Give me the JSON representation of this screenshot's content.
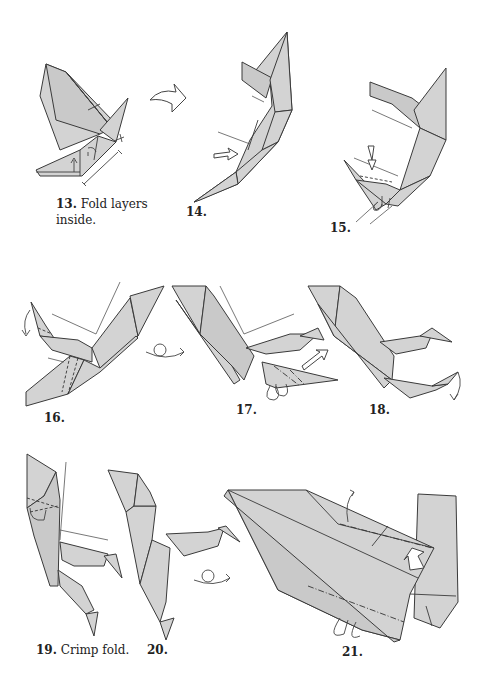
{
  "page": {
    "paper_color": "#d3d3d3",
    "outline_color": "#3a3a3a",
    "background": "#ffffff"
  },
  "steps": [
    {
      "number": "13.",
      "caption": "Fold layers",
      "caption_line2": "inside."
    },
    {
      "number": "14.",
      "caption": ""
    },
    {
      "number": "15.",
      "caption": ""
    },
    {
      "number": "16.",
      "caption": ""
    },
    {
      "number": "17.",
      "caption": ""
    },
    {
      "number": "18.",
      "caption": ""
    },
    {
      "number": "19.",
      "caption": "Crimp fold."
    },
    {
      "number": "20.",
      "caption": ""
    },
    {
      "number": "21.",
      "caption": ""
    }
  ],
  "symbols": {
    "turn_over": "turn-over-arrow",
    "push_arrow": "hollow-push-arrow",
    "fold_behind": "fold-arrow"
  }
}
